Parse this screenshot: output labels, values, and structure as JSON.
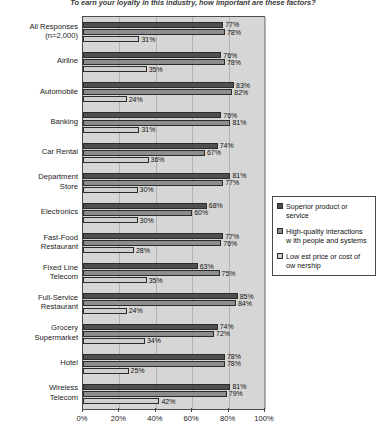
{
  "chart_data": {
    "type": "bar",
    "orientation": "horizontal",
    "title": "To earn your loyalty in this industry, how important are these factors?",
    "xlabel": "",
    "ylabel": "",
    "xlim": [
      0,
      100
    ],
    "xticks": [
      "0%",
      "20%",
      "40%",
      "60%",
      "80%",
      "100%"
    ],
    "xtick_values": [
      0,
      20,
      40,
      60,
      80,
      100
    ],
    "grid": true,
    "legend_position": "right",
    "categories": [
      "All Responses (n=2,000)",
      "Airline",
      "Automobile",
      "Banking",
      "Car Rental",
      "Department Store",
      "Electronics",
      "Fast-Food Restaurant",
      "Fixed Line Telecom",
      "Full-Service Restaurant",
      "Grocery Supermarket",
      "Hotel",
      "Wireless Telecom"
    ],
    "category_lines": [
      [
        "All Responses",
        "(n=2,000)"
      ],
      [
        "Airline"
      ],
      [
        "Automobile"
      ],
      [
        "Banking"
      ],
      [
        "Car Rental"
      ],
      [
        "Department",
        "Store"
      ],
      [
        "Electronics"
      ],
      [
        "Fast-Food",
        "Restaurant"
      ],
      [
        "Fixed Line",
        "Telecom"
      ],
      [
        "Full-Service",
        "Restaurant"
      ],
      [
        "Grocery",
        "Supermarket"
      ],
      [
        "Hotel"
      ],
      [
        "Wireless",
        "Telecom"
      ]
    ],
    "series": [
      {
        "name": "Superior product or service",
        "color": "#4f4f4f",
        "values": [
          77,
          76,
          83,
          76,
          74,
          81,
          68,
          77,
          63,
          85,
          74,
          78,
          81
        ],
        "labels": [
          "77%",
          "76%",
          "83%",
          "76%",
          "74%",
          "81%",
          "68%",
          "77%",
          "63%",
          "85%",
          "74%",
          "78%",
          "81%"
        ]
      },
      {
        "name": "High-quality interactions w ith people and systems",
        "color": "#8d8d8d",
        "values": [
          78,
          78,
          82,
          81,
          67,
          77,
          60,
          76,
          75,
          84,
          72,
          78,
          79
        ],
        "labels": [
          "78%",
          "78%",
          "82%",
          "81%",
          "67%",
          "77%",
          "60%",
          "76%",
          "75%",
          "84%",
          "72%",
          "78%",
          "79%"
        ]
      },
      {
        "name": "Low est price or cost of ow nership",
        "color": "#cfcfcf",
        "values": [
          31,
          35,
          24,
          31,
          36,
          30,
          30,
          28,
          35,
          24,
          34,
          25,
          42
        ],
        "labels": [
          "31%",
          "35%",
          "24%",
          "31%",
          "36%",
          "30%",
          "30%",
          "28%",
          "35%",
          "24%",
          "34%",
          "25%",
          "42%"
        ]
      }
    ]
  },
  "legend": {
    "items": [
      {
        "label_lines": [
          "Superior product or",
          "service"
        ]
      },
      {
        "label_lines": [
          "High-quality interactions",
          "w ith people and systems"
        ]
      },
      {
        "label_lines": [
          "Low est price or cost of",
          "ow nership"
        ]
      }
    ]
  }
}
